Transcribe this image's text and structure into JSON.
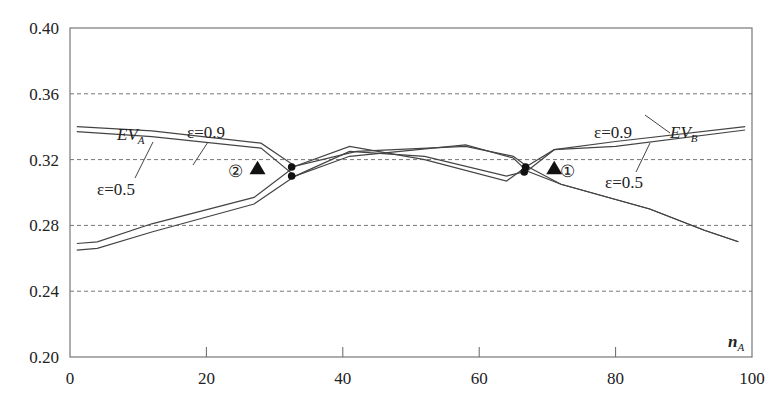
{
  "chart_data": {
    "type": "line",
    "title": "",
    "xlabel": "n_A",
    "ylabel": "",
    "xlim": [
      0,
      100
    ],
    "ylim": [
      0.2,
      0.4
    ],
    "x_ticks": [
      "0",
      "20",
      "40",
      "60",
      "80",
      "100"
    ],
    "y_ticks": [
      "0.20",
      "0.24",
      "0.28",
      "0.32",
      "0.36",
      "0.40"
    ],
    "grid": {
      "horizontal_dashed_at": [
        0.24,
        0.28,
        0.32,
        0.36
      ],
      "vertical": false
    },
    "legend": "none (inline annotations)",
    "series": [
      {
        "name": "EV_A, ε=0.9",
        "x": [
          1,
          12,
          28,
          33,
          42,
          58,
          65,
          67,
          72,
          85,
          93,
          98
        ],
        "y": [
          0.34,
          0.3375,
          0.33,
          0.316,
          0.325,
          0.328,
          0.322,
          0.316,
          0.305,
          0.29,
          0.277,
          0.27
        ]
      },
      {
        "name": "EV_A, ε=0.5",
        "x": [
          1,
          12,
          28,
          33,
          41,
          58,
          65,
          67,
          72,
          85,
          93,
          98
        ],
        "y": [
          0.337,
          0.334,
          0.327,
          0.31,
          0.322,
          0.329,
          0.321,
          0.313,
          0.305,
          0.29,
          0.277,
          0.27
        ]
      },
      {
        "name": "EV_B, ε=0.9",
        "x": [
          1,
          4,
          12,
          27,
          33,
          41,
          52,
          64,
          67,
          71,
          80,
          99
        ],
        "y": [
          0.269,
          0.27,
          0.281,
          0.297,
          0.316,
          0.328,
          0.32,
          0.307,
          0.316,
          0.326,
          0.331,
          0.34
        ]
      },
      {
        "name": "EV_B, ε=0.5",
        "x": [
          1,
          4,
          12,
          27,
          33,
          41,
          52,
          64,
          67,
          71,
          80,
          99
        ],
        "y": [
          0.265,
          0.266,
          0.276,
          0.293,
          0.31,
          0.325,
          0.322,
          0.31,
          0.313,
          0.326,
          0.328,
          0.338
        ]
      }
    ],
    "markers": [
      {
        "type": "dot",
        "x": 32.5,
        "y": 0.3155
      },
      {
        "type": "dot",
        "x": 32.5,
        "y": 0.31
      },
      {
        "type": "dot",
        "x": 66.8,
        "y": 0.3155
      },
      {
        "type": "dot",
        "x": 66.6,
        "y": 0.3125
      },
      {
        "type": "triangle",
        "label": "②",
        "x": 27.5,
        "y": 0.3145
      },
      {
        "type": "triangle",
        "label": "①",
        "x": 71,
        "y": 0.3145
      }
    ],
    "annotations": [
      {
        "text": "EV_A",
        "x": 7,
        "y": 0.345
      },
      {
        "text": "ε=0.9",
        "x": 20.5,
        "y": 0.3455
      },
      {
        "text": "ε=0.5",
        "x": 10.5,
        "y": 0.301
      },
      {
        "text": "ε=0.9",
        "x": 76,
        "y": 0.3455
      },
      {
        "text": "EV_B",
        "x": 87,
        "y": 0.3455
      },
      {
        "text": "ε=0.5",
        "x": 79,
        "y": 0.3035
      },
      {
        "text": "n_A",
        "x": 96.5,
        "y": 0.214
      }
    ]
  },
  "labels": {
    "ev_a": "EV",
    "ev_a_sub": "A",
    "ev_b": "EV",
    "ev_b_sub": "B",
    "eps_09_left": "ε=0.9",
    "eps_05_left": "ε=0.5",
    "eps_09_right": "ε=0.9",
    "eps_05_right": "ε=0.5",
    "marker_1": "①",
    "marker_2": "②",
    "xlabel_main": "n",
    "xlabel_sub": "A"
  },
  "colors": {
    "line": "#444444",
    "axis": "#666666",
    "grid": "#777777",
    "marker": "#111111"
  }
}
